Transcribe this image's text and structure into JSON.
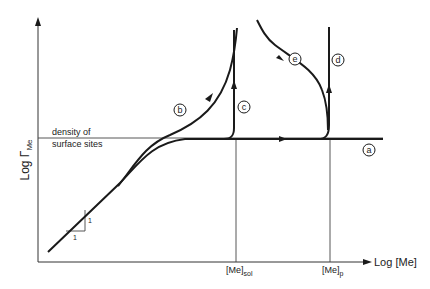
{
  "axes": {
    "y_label": "Log Γ",
    "y_label_sub": "Me",
    "x_label": "Log [Me]"
  },
  "reference_line": {
    "label_line1": "density of",
    "label_line2": "surface sites"
  },
  "x_markers": [
    {
      "label": "[Me]",
      "sub": "sol"
    },
    {
      "label": "[Me]",
      "sub": "p"
    }
  ],
  "slope_triangle": {
    "run_label": "1",
    "rise_label": "1"
  },
  "curves": [
    {
      "id": "a",
      "label": "a"
    },
    {
      "id": "b",
      "label": "b"
    },
    {
      "id": "c",
      "label": "c"
    },
    {
      "id": "d",
      "label": "d"
    },
    {
      "id": "e",
      "label": "e"
    }
  ],
  "colors": {
    "line": "#1a1a1a",
    "thin": "#444444",
    "background": "#ffffff"
  }
}
